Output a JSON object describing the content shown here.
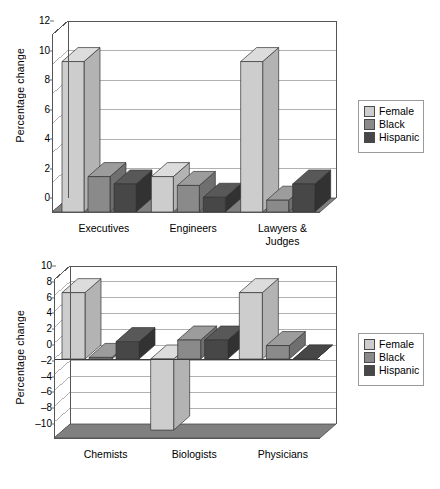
{
  "colors": {
    "female_front": "#cdcdcd",
    "female_top": "#dcdcdc",
    "female_side": "#b3b3b3",
    "black_front": "#8a8a8a",
    "black_top": "#9c9c9c",
    "black_side": "#6f6f6f",
    "hispanic_front": "#474747",
    "hispanic_top": "#585858",
    "hispanic_side": "#323232",
    "floor": "#808080",
    "grid": "#9d9d9d",
    "axis": "#555555",
    "legend_border": "#9a9a9a"
  },
  "legend": {
    "entries": [
      {
        "label": "Female",
        "series": "female"
      },
      {
        "label": "Black",
        "series": "black"
      },
      {
        "label": "Hispanic",
        "series": "hispanic"
      }
    ]
  },
  "chart_data": [
    {
      "id": "top",
      "type": "bar",
      "title": "",
      "xlabel": "",
      "ylabel": "Percentage change",
      "ylim": [
        0,
        12
      ],
      "yticks": [
        0,
        2,
        4,
        6,
        8,
        10,
        12
      ],
      "ytick_labels": [
        "0",
        "2",
        "4",
        "6",
        "8",
        "10",
        "12"
      ],
      "grid": true,
      "legend_position": "right",
      "categories": [
        "Executives",
        "Engineers",
        "Lawyers &\nJudges"
      ],
      "category_lines": [
        [
          "Executives"
        ],
        [
          "Engineers"
        ],
        [
          "Lawyers &",
          "Judges"
        ]
      ],
      "series": [
        {
          "name": "Female",
          "values": [
            10.2,
            2.4,
            10.2
          ]
        },
        {
          "name": "Black",
          "values": [
            2.4,
            1.8,
            0.8
          ]
        },
        {
          "name": "Hispanic",
          "values": [
            1.9,
            1.0,
            1.9
          ]
        }
      ]
    },
    {
      "id": "bottom",
      "type": "bar",
      "title": "",
      "xlabel": "",
      "ylabel": "Percentage change",
      "ylim": [
        -10,
        10
      ],
      "yticks": [
        -10,
        -8,
        -6,
        -4,
        -2,
        0,
        2,
        4,
        6,
        8,
        10
      ],
      "ytick_labels": [
        "–10",
        "–8",
        "–6",
        "–4",
        "–2",
        "0",
        "2",
        "4",
        "6",
        "8",
        "10"
      ],
      "grid": true,
      "legend_position": "right",
      "categories": [
        "Chemists",
        "Biologists",
        "Physicians"
      ],
      "category_lines": [
        [
          "Chemists"
        ],
        [
          "Biologists"
        ],
        [
          "Physicians"
        ]
      ],
      "series": [
        {
          "name": "Female",
          "values": [
            8.4,
            -9.0,
            8.4
          ]
        },
        {
          "name": "Black",
          "values": [
            0.2,
            2.4,
            1.7
          ]
        },
        {
          "name": "Hispanic",
          "values": [
            2.2,
            2.4,
            0.0
          ]
        }
      ]
    }
  ]
}
